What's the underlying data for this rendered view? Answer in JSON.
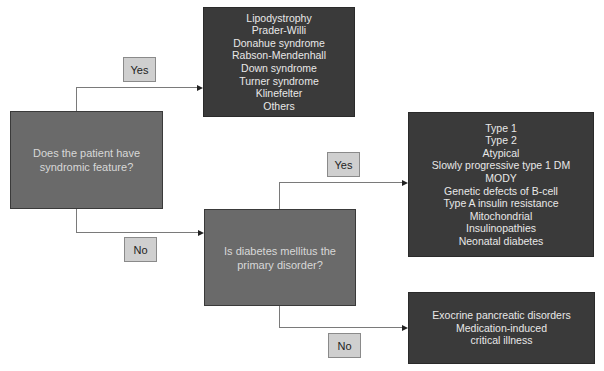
{
  "diagram": {
    "type": "flowchart",
    "colors": {
      "question_fill": "#6a6a6a",
      "outcome_fill": "#3a3a3a",
      "label_fill": "#cfcfcf",
      "connector": "#7a7a7a"
    },
    "nodes": {
      "q1": {
        "lines": [
          "Does the patient have",
          "syndromic feature?"
        ]
      },
      "q2": {
        "lines": [
          "Is diabetes mellitus the",
          "primary disorder?"
        ]
      },
      "syndromes": {
        "lines": [
          "Lipodystrophy",
          "Prader-Willi",
          "Donahue syndrome",
          "Rabson-Mendenhall",
          "Down syndrome",
          "Turner syndrome",
          "Klinefelter",
          "Others"
        ]
      },
      "primary_dm": {
        "lines": [
          "Type 1",
          "Type 2",
          "Atypical",
          "Slowly progressive type 1 DM",
          "MODY",
          "Genetic defects of B-cell",
          "Type A insulin resistance",
          "Mitochondrial",
          "Insulinopathies",
          "Neonatal diabetes"
        ]
      },
      "secondary": {
        "lines": [
          "Exocrine pancreatic disorders",
          "Medication-induced",
          "critical illness"
        ]
      }
    },
    "edges": [
      {
        "from": "q1",
        "to": "syndromes",
        "label": "Yes"
      },
      {
        "from": "q1",
        "to": "q2",
        "label": "No"
      },
      {
        "from": "q2",
        "to": "primary_dm",
        "label": "Yes"
      },
      {
        "from": "q2",
        "to": "secondary",
        "label": "No"
      }
    ]
  }
}
